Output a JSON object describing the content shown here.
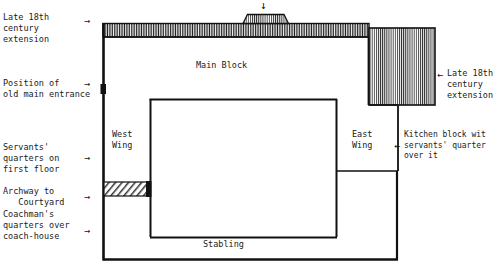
{
  "diagram": {
    "line_color": "#111111",
    "background": "#ffffff"
  },
  "labels": {
    "late_18th_left": "Late 18th\ncentury\nextension",
    "old_entrance": "Position of\nold main entrance",
    "servants_quarters": "Servants'\nquarters on\nfirst floor",
    "archway": "Archway to\n   Courtyard",
    "coachman": "Coachman's\nquarters over\ncoach-house",
    "late_18th_right": "Late 18th\ncentury\nextension",
    "kitchen_block": "Kitchen block wit\nservants' quarter\nover it"
  },
  "rooms": {
    "main_block": "Main Block",
    "west_wing": "West\nWing",
    "east_wing": "East\nWing",
    "stabling": "Stabling"
  },
  "icons": {
    "arrow_right": "→",
    "arrow_left": "←",
    "arrow_down": "↓"
  }
}
